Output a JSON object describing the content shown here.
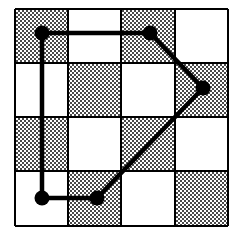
{
  "figure": {
    "background_color": "#ffffff",
    "ink_color": "#000000",
    "shade_color": "#9a9a9a",
    "shade_style": "dithered-checker-halftone"
  },
  "chart_data": {
    "type": "diagram",
    "grid": {
      "rows": 4,
      "cols": 4,
      "x_left": 15,
      "y_top": 9,
      "x_right": 228,
      "y_bottom": 226,
      "cell_width": 53.25,
      "cell_height": 54.25,
      "x_lines": [
        15,
        68,
        121,
        175,
        228
      ],
      "y_lines": [
        9,
        63,
        117,
        171,
        226
      ],
      "border_width": 2,
      "line_width": 2,
      "pattern": "checkerboard",
      "shaded_cells": [
        [
          0,
          0
        ],
        [
          0,
          2
        ],
        [
          1,
          1
        ],
        [
          1,
          3
        ],
        [
          2,
          0
        ],
        [
          2,
          2
        ],
        [
          3,
          1
        ],
        [
          3,
          3
        ]
      ],
      "cell_fill_map": [
        [
          "shaded",
          "white",
          "shaded",
          "white"
        ],
        [
          "white",
          "shaded",
          "white",
          "shaded"
        ],
        [
          "shaded",
          "white",
          "shaded",
          "white"
        ],
        [
          "white",
          "shaded",
          "white",
          "shaded"
        ]
      ]
    },
    "polygon": {
      "closed": true,
      "stroke_width": 4.5,
      "vertex_radius": 7.5,
      "vertex_count": 5,
      "vertices": [
        {
          "id": "v1",
          "label": "top-left-vertex",
          "x": 42,
          "y": 33
        },
        {
          "id": "v2",
          "label": "top-right-vertex",
          "x": 150,
          "y": 33
        },
        {
          "id": "v3",
          "label": "right-vertex",
          "x": 203,
          "y": 88
        },
        {
          "id": "v4",
          "label": "bottom-right-vertex",
          "x": 97,
          "y": 198
        },
        {
          "id": "v5",
          "label": "bottom-left-vertex",
          "x": 42,
          "y": 198
        }
      ],
      "edges": [
        {
          "from": "v1",
          "to": "v2",
          "orientation": "horizontal"
        },
        {
          "from": "v2",
          "to": "v3",
          "orientation": "diagonal"
        },
        {
          "from": "v3",
          "to": "v4",
          "orientation": "diagonal"
        },
        {
          "from": "v4",
          "to": "v5",
          "orientation": "horizontal"
        },
        {
          "from": "v5",
          "to": "v1",
          "orientation": "vertical"
        }
      ]
    }
  }
}
